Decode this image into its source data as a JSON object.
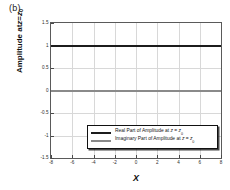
{
  "figure": {
    "panel_label": "(b)",
    "background_color": "#ffffff"
  },
  "chart_data": {
    "type": "line",
    "title": "",
    "panel_label": "(b)",
    "xlabel": "X",
    "ylabel": "Amplitude at z = z0",
    "ylabel_parts": {
      "prefix": "Amplitude at ",
      "var1": "z",
      "eq": " = ",
      "var2": "z",
      "sub": "0"
    },
    "xlim": [
      -8,
      8
    ],
    "ylim": [
      -1.5,
      1.5
    ],
    "xticks": [
      -8,
      -6,
      -4,
      -2,
      0,
      2,
      4,
      6,
      8
    ],
    "xtick_labels": [
      "-8",
      "-6",
      "-4",
      "-2",
      "0",
      "2",
      "4",
      "6",
      "8"
    ],
    "yticks": [
      1.5,
      1,
      0.5,
      0,
      -0.5,
      -1,
      -1.5
    ],
    "ytick_labels": [
      "1.5",
      "1",
      "0.5",
      "0",
      "-0.5",
      "-1",
      "-1.5"
    ],
    "grid": true,
    "grid_color": "#d8d8d8",
    "legend_position": "lower-center-right",
    "series": [
      {
        "name": "Real Part of Amplitude at z = z0",
        "label_parts": {
          "prefix": "Real Part of Amplitude at ",
          "var1": "z",
          "eq": " = ",
          "var2": "z",
          "sub": "0"
        },
        "color": "#1c1c1c",
        "constant_value": 1,
        "x": [
          -8,
          -6,
          -4,
          -2,
          0,
          2,
          4,
          6,
          8
        ],
        "values": [
          1,
          1,
          1,
          1,
          1,
          1,
          1,
          1,
          1
        ]
      },
      {
        "name": "Imaginary Part of Amplitude at z = z0",
        "label_parts": {
          "prefix": "Imaginary Part of Amplitude at ",
          "var1": "z",
          "eq": " = ",
          "var2": "z",
          "sub": "0"
        },
        "color": "#8a8a8a",
        "constant_value": 0,
        "x": [
          -8,
          -6,
          -4,
          -2,
          0,
          2,
          4,
          6,
          8
        ],
        "values": [
          0,
          0,
          0,
          0,
          0,
          0,
          0,
          0,
          0
        ]
      }
    ]
  }
}
